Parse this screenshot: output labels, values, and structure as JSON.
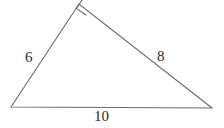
{
  "figure": {
    "type": "right-triangle-diagram",
    "background_color": "#ffffff",
    "stroke_color": "#6a6a6a",
    "text_color": "#2b2b2b",
    "stroke_width": 1.1,
    "canvas": {
      "width": 224,
      "height": 128
    }
  },
  "vertices": {
    "bottom_left": {
      "x": 11,
      "y": 107
    },
    "apex": {
      "x": 79,
      "y": 4
    },
    "bottom_right": {
      "x": 212,
      "y": 108
    }
  },
  "right_angle_marker": {
    "at_vertex": "apex",
    "size": 11,
    "shape": "square"
  },
  "sides": [
    {
      "name": "leg-a",
      "label": "6",
      "from": "bottom_left",
      "to": "apex"
    },
    {
      "name": "leg-b",
      "label": "8",
      "from": "apex",
      "to": "bottom_right"
    },
    {
      "name": "hypotenuse",
      "label": "10",
      "from": "bottom_left",
      "to": "bottom_right"
    }
  ],
  "labels": {
    "leg_a": "6",
    "leg_b": "8",
    "hypotenuse": "10"
  },
  "geometry_path": {
    "triangle_points": "11,107 79,4 212,108",
    "right_angle_points": "86.4,15.2 76.4,8.4 83.1,-1.6"
  }
}
